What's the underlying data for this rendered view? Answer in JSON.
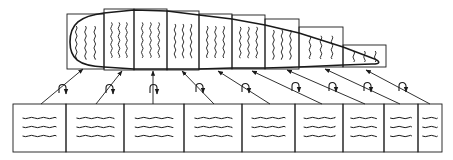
{
  "diagram": {
    "type": "airfoil-panel-mapping",
    "colors": {
      "stroke": "#1a1a1a",
      "background": "#ffffff"
    },
    "airfoil_panels": [
      {
        "id": 1,
        "x": 67,
        "y": 14,
        "w": 37,
        "h": 55,
        "wave_lines": 3,
        "orientation": "vertical"
      },
      {
        "id": 2,
        "x": 104,
        "y": 9,
        "w": 30,
        "h": 61,
        "wave_lines": 3,
        "orientation": "vertical"
      },
      {
        "id": 3,
        "x": 134,
        "y": 9,
        "w": 33,
        "h": 61,
        "wave_lines": 3,
        "orientation": "vertical"
      },
      {
        "id": 4,
        "x": 167,
        "y": 11,
        "w": 32,
        "h": 59,
        "wave_lines": 3,
        "orientation": "vertical"
      },
      {
        "id": 5,
        "x": 199,
        "y": 14,
        "w": 33,
        "h": 55,
        "wave_lines": 3,
        "orientation": "vertical"
      },
      {
        "id": 6,
        "x": 232,
        "y": 15,
        "w": 33,
        "h": 54,
        "wave_lines": 3,
        "orientation": "vertical"
      },
      {
        "id": 7,
        "x": 265,
        "y": 19,
        "w": 34,
        "h": 50,
        "wave_lines": 3,
        "orientation": "vertical"
      },
      {
        "id": 8,
        "x": 299,
        "y": 27,
        "w": 44,
        "h": 40,
        "wave_lines": 3,
        "orientation": "vertical"
      },
      {
        "id": 9,
        "x": 343,
        "y": 45,
        "w": 43,
        "h": 22,
        "wave_lines": 3,
        "orientation": "vertical"
      }
    ],
    "flat_panels": [
      {
        "id": 1,
        "x": 13,
        "y": 104,
        "w": 53,
        "h": 48,
        "wave_lines": 3,
        "orientation": "horizontal"
      },
      {
        "id": 2,
        "x": 66,
        "y": 104,
        "w": 58,
        "h": 48,
        "wave_lines": 3,
        "orientation": "horizontal"
      },
      {
        "id": 3,
        "x": 124,
        "y": 104,
        "w": 60,
        "h": 48,
        "wave_lines": 3,
        "orientation": "horizontal"
      },
      {
        "id": 4,
        "x": 184,
        "y": 104,
        "w": 58,
        "h": 48,
        "wave_lines": 3,
        "orientation": "horizontal"
      },
      {
        "id": 5,
        "x": 242,
        "y": 104,
        "w": 53,
        "h": 48,
        "wave_lines": 3,
        "orientation": "horizontal"
      },
      {
        "id": 6,
        "x": 295,
        "y": 104,
        "w": 48,
        "h": 48,
        "wave_lines": 3,
        "orientation": "horizontal"
      },
      {
        "id": 7,
        "x": 343,
        "y": 104,
        "w": 41,
        "h": 48,
        "wave_lines": 3,
        "orientation": "horizontal"
      },
      {
        "id": 8,
        "x": 384,
        "y": 104,
        "w": 34,
        "h": 48,
        "wave_lines": 3,
        "orientation": "horizontal"
      },
      {
        "id": 9,
        "x": 418,
        "y": 104,
        "w": 24,
        "h": 48,
        "wave_lines": 3,
        "orientation": "horizontal"
      }
    ],
    "mapping_arrows": [
      {
        "from": [
          41,
          104
        ],
        "to": [
          83,
          69
        ],
        "rot": [
          62,
          88
        ]
      },
      {
        "from": [
          96,
          104
        ],
        "to": [
          122,
          71
        ],
        "rot": [
          109,
          88
        ]
      },
      {
        "from": [
          153,
          104
        ],
        "to": [
          153,
          71
        ],
        "rot": [
          153,
          88
        ]
      },
      {
        "from": [
          214,
          104
        ],
        "to": [
          182,
          71
        ],
        "rot": [
          199,
          87
        ]
      },
      {
        "from": [
          270,
          104
        ],
        "to": [
          218,
          71
        ],
        "rot": [
          245,
          87
        ]
      },
      {
        "from": [
          322,
          104
        ],
        "to": [
          252,
          71
        ],
        "rot": [
          295,
          86
        ]
      },
      {
        "from": [
          365,
          104
        ],
        "to": [
          287,
          70
        ],
        "rot": [
          332,
          86
        ]
      },
      {
        "from": [
          400,
          104
        ],
        "to": [
          325,
          69
        ],
        "rot": [
          367,
          86
        ]
      },
      {
        "from": [
          430,
          104
        ],
        "to": [
          366,
          70
        ],
        "rot": [
          402,
          86
        ]
      }
    ]
  }
}
